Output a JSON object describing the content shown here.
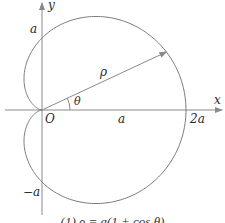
{
  "figure": {
    "type": "polar-curve",
    "curve": "cardioid",
    "equation_caption": "(1)   ρ = a(1 + cos θ)",
    "axes": {
      "x_label": "x",
      "y_label": "y",
      "origin_label": "O"
    },
    "tick_labels": {
      "y_positive": "a",
      "y_negative": "−a",
      "x_mid": "a",
      "x_end": "2a"
    },
    "annotations": {
      "radius_label": "ρ",
      "angle_label": "θ"
    },
    "geometry": {
      "origin_px": [
        42,
        110
      ],
      "a_px": 72,
      "ray_angle_deg": 25
    },
    "colors": {
      "curve": "#7a7a7a",
      "axes": "#8a8a8a",
      "text": "#2a2a2a"
    }
  },
  "chart_data": {
    "type": "line",
    "xlabel": "x",
    "ylabel": "y",
    "polar_equation": "ρ = a(1 + cos θ)",
    "x_ticks": [
      "O",
      "a",
      "2a"
    ],
    "y_ticks": [
      "a",
      "−a"
    ],
    "xlim": [
      "-0.5a",
      "2.2a"
    ],
    "ylim": [
      "-1.4a",
      "1.4a"
    ],
    "grid": false
  }
}
